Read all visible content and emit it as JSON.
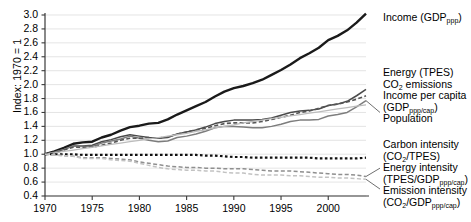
{
  "chart_data": {
    "type": "line",
    "title": "",
    "xlabel": "",
    "ylabel": "Index: 1970 = 1",
    "xlim": [
      1970,
      2004
    ],
    "ylim": [
      0.4,
      3.0
    ],
    "ytick_labels": [
      "3.0",
      "2.8",
      "2.6",
      "2.4",
      "2.2",
      "2.0",
      "1.8",
      "1.6",
      "1.4",
      "1.2",
      "1.0",
      "0.8",
      "0.6",
      "0.4"
    ],
    "ytick_values": [
      3.0,
      2.8,
      2.6,
      2.4,
      2.2,
      2.0,
      1.8,
      1.6,
      1.4,
      1.2,
      1.0,
      0.8,
      0.6,
      0.4
    ],
    "xtick_labels": [
      "1970",
      "1975",
      "1980",
      "1985",
      "1990",
      "1995",
      "2000"
    ],
    "xtick_values": [
      1970,
      1975,
      1980,
      1985,
      1990,
      1995,
      2000
    ],
    "grid": true,
    "legend_position": "right-inline",
    "x": [
      1970,
      1971,
      1972,
      1973,
      1974,
      1975,
      1976,
      1977,
      1978,
      1979,
      1980,
      1981,
      1982,
      1983,
      1984,
      1985,
      1986,
      1987,
      1988,
      1989,
      1990,
      1991,
      1992,
      1993,
      1994,
      1995,
      1996,
      1997,
      1998,
      1999,
      2000,
      2001,
      2002,
      2003,
      2004
    ],
    "series": [
      {
        "name": "Income (GDP_ppp)",
        "label_lines": [
          "Income (GDP",
          "ppp",
          ")"
        ],
        "style": "solid",
        "color": "#1a1a1a",
        "width": 2.4,
        "label_y": 1.0,
        "values": [
          1.0,
          1.04,
          1.09,
          1.15,
          1.17,
          1.18,
          1.24,
          1.28,
          1.34,
          1.39,
          1.41,
          1.44,
          1.45,
          1.5,
          1.57,
          1.63,
          1.69,
          1.75,
          1.83,
          1.9,
          1.95,
          1.98,
          2.02,
          2.07,
          2.14,
          2.21,
          2.29,
          2.38,
          2.45,
          2.53,
          2.64,
          2.7,
          2.78,
          2.89,
          3.02
        ]
      },
      {
        "name": "Energy (TPES)",
        "label_lines": [
          "Energy (TPES)"
        ],
        "style": "solid",
        "color": "#4a4a4a",
        "width": 1.5,
        "label_y": 2.18,
        "values": [
          1.0,
          1.03,
          1.07,
          1.12,
          1.12,
          1.13,
          1.18,
          1.21,
          1.25,
          1.28,
          1.26,
          1.24,
          1.23,
          1.24,
          1.29,
          1.32,
          1.35,
          1.39,
          1.44,
          1.47,
          1.49,
          1.49,
          1.49,
          1.5,
          1.52,
          1.56,
          1.6,
          1.62,
          1.63,
          1.65,
          1.7,
          1.72,
          1.76,
          1.84,
          1.93
        ]
      },
      {
        "name": "CO2 emissions",
        "label_lines": [
          "CO",
          "2",
          " emissions"
        ],
        "style": "solid",
        "color": "#7d7d7d",
        "width": 1.5,
        "label_y": 2.0,
        "values": [
          1.0,
          1.03,
          1.07,
          1.12,
          1.11,
          1.11,
          1.16,
          1.19,
          1.22,
          1.26,
          1.23,
          1.2,
          1.18,
          1.19,
          1.24,
          1.26,
          1.29,
          1.33,
          1.38,
          1.4,
          1.4,
          1.39,
          1.38,
          1.38,
          1.4,
          1.43,
          1.47,
          1.49,
          1.49,
          1.5,
          1.55,
          1.57,
          1.6,
          1.68,
          1.77
        ]
      },
      {
        "name": "Income per capita (GDP_ppp/cap)",
        "label_lines": [
          "Income per capita",
          "(GDP",
          "ppp/cap",
          ")"
        ],
        "style": "dashed",
        "color": "#555555",
        "width": 1.6,
        "label_y": 1.85,
        "values": [
          1.0,
          1.02,
          1.06,
          1.1,
          1.1,
          1.1,
          1.13,
          1.16,
          1.2,
          1.23,
          1.23,
          1.24,
          1.23,
          1.25,
          1.29,
          1.32,
          1.35,
          1.37,
          1.41,
          1.44,
          1.45,
          1.45,
          1.45,
          1.47,
          1.5,
          1.53,
          1.56,
          1.6,
          1.62,
          1.66,
          1.7,
          1.72,
          1.75,
          1.79,
          1.84
        ]
      },
      {
        "name": "Population",
        "label_lines": [
          "Population"
        ],
        "style": "solid",
        "color": "#bcbcbc",
        "width": 1.3,
        "label_y": 1.62,
        "values": [
          1.0,
          1.02,
          1.04,
          1.06,
          1.08,
          1.1,
          1.12,
          1.14,
          1.16,
          1.18,
          1.2,
          1.22,
          1.24,
          1.26,
          1.28,
          1.3,
          1.33,
          1.35,
          1.38,
          1.4,
          1.42,
          1.45,
          1.47,
          1.49,
          1.51,
          1.53,
          1.55,
          1.57,
          1.59,
          1.61,
          1.63,
          1.65,
          1.67,
          1.69,
          1.71
        ]
      },
      {
        "name": "Carbon intensity (CO2/TPES)",
        "label_lines": [
          "Carbon intensity",
          "(CO",
          "2",
          "/TPES)"
        ],
        "style": "dotted-bold",
        "color": "#111111",
        "width": 2.2,
        "label_y": 1.18,
        "values": [
          1.0,
          1.0,
          1.0,
          1.0,
          0.99,
          0.99,
          0.99,
          0.99,
          0.99,
          0.99,
          0.99,
          0.99,
          0.99,
          0.99,
          0.99,
          0.99,
          0.99,
          0.98,
          0.98,
          0.97,
          0.96,
          0.96,
          0.95,
          0.95,
          0.95,
          0.95,
          0.95,
          0.95,
          0.95,
          0.94,
          0.94,
          0.94,
          0.94,
          0.94,
          0.95
        ]
      },
      {
        "name": "Energy intensity (TPES/GDP_ppp/cap)",
        "label_lines": [
          "Energy intensity",
          "(TPES/GDP",
          "ppp/cap",
          ")"
        ],
        "style": "dashed",
        "color": "#8f8f8f",
        "width": 1.5,
        "label_y": 0.86,
        "values": [
          1.0,
          0.99,
          0.98,
          0.97,
          0.95,
          0.95,
          0.95,
          0.94,
          0.93,
          0.92,
          0.89,
          0.87,
          0.85,
          0.83,
          0.82,
          0.81,
          0.81,
          0.8,
          0.8,
          0.79,
          0.79,
          0.79,
          0.78,
          0.77,
          0.76,
          0.76,
          0.76,
          0.75,
          0.74,
          0.73,
          0.72,
          0.71,
          0.71,
          0.7,
          0.68
        ]
      },
      {
        "name": "Emission intensity (CO2/GDP_ppp/cap)",
        "label_lines": [
          "Emission intensity",
          "(CO",
          "2",
          "/GDP",
          "ppp/cap",
          ")"
        ],
        "style": "dashed",
        "color": "#c2c2c2",
        "width": 1.5,
        "label_y": 0.6,
        "values": [
          1.0,
          0.99,
          0.98,
          0.97,
          0.94,
          0.94,
          0.94,
          0.92,
          0.91,
          0.9,
          0.87,
          0.84,
          0.81,
          0.79,
          0.78,
          0.77,
          0.77,
          0.76,
          0.76,
          0.74,
          0.73,
          0.73,
          0.71,
          0.7,
          0.7,
          0.7,
          0.69,
          0.69,
          0.68,
          0.67,
          0.67,
          0.66,
          0.66,
          0.65,
          0.64
        ]
      }
    ]
  },
  "axis": {
    "ylabel": "Index: 1970 = 1"
  },
  "legend": {
    "items": [
      {
        "id": "income",
        "l1": "Income (GDP",
        "sub": "ppp",
        "l2": ")"
      },
      {
        "id": "energy",
        "l1": "Energy (TPES)"
      },
      {
        "id": "co2",
        "l1": "CO",
        "sub": "2",
        "l2": " emissions"
      },
      {
        "id": "income-per-capita",
        "l1": "Income per capita",
        "l2": "(GDP",
        "sub": "ppp/cap",
        "l3": ")"
      },
      {
        "id": "population",
        "l1": "Population"
      },
      {
        "id": "carbon-intensity",
        "l1": "Carbon intensity",
        "l2": "(CO",
        "sub": "2",
        "l3": "/TPES)"
      },
      {
        "id": "energy-intensity",
        "l1": "Energy intensity",
        "l2": "(TPES/GDP",
        "sub": "ppp/cap",
        "l3": ")"
      },
      {
        "id": "emission-intensity",
        "l1": "Emission intensity",
        "l2": "(CO",
        "sub": "2",
        "l3": "/GDP",
        "sub2": "ppp/cap",
        "l4": ")"
      }
    ]
  }
}
